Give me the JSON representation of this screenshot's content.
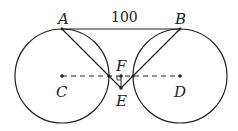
{
  "diagram": {
    "type": "geometry",
    "labels": {
      "A": "A",
      "B": "B",
      "C": "C",
      "D": "D",
      "E": "E",
      "F": "F"
    },
    "segment_AB_length": "100",
    "points": {
      "A": [
        62,
        29
      ],
      "B": [
        180,
        29
      ],
      "C": [
        62,
        76
      ],
      "D": [
        180,
        76
      ],
      "E": [
        121,
        88
      ],
      "F": [
        121,
        76
      ],
      "T1": [
        109,
        76
      ],
      "T2": [
        133,
        76
      ]
    },
    "circles": [
      {
        "center": "C",
        "radius": 47
      },
      {
        "center": "D",
        "radius": 47
      }
    ],
    "colors": {
      "stroke": "#222222",
      "background": "#ffffff"
    }
  }
}
